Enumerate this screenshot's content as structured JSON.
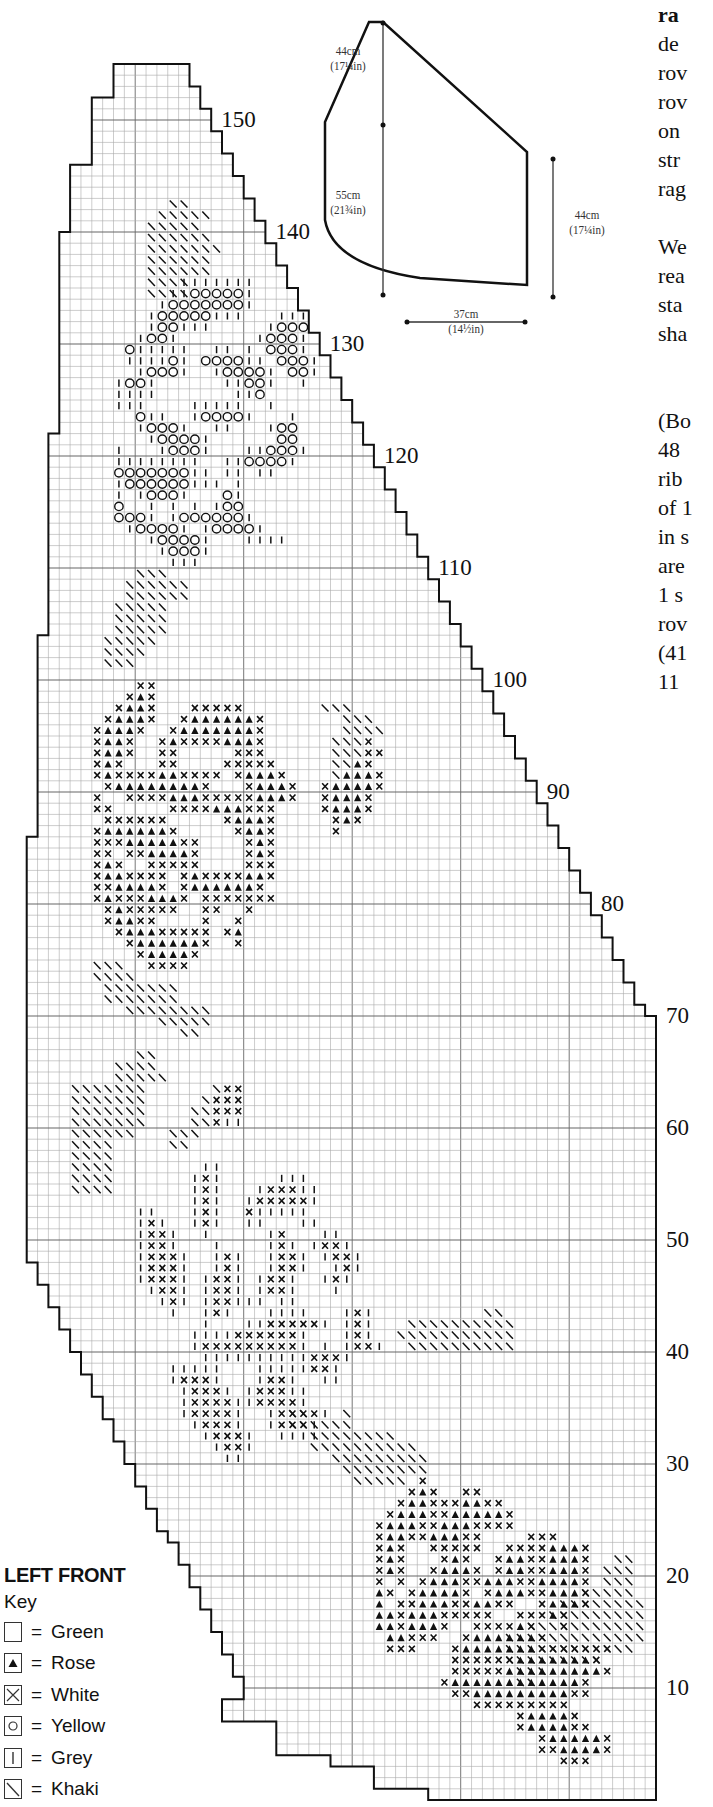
{
  "title": "LEFT FRONT",
  "key_label": "Key",
  "legend": [
    {
      "symbol": "empty-square",
      "label": "Green"
    },
    {
      "symbol": "filled-triangle",
      "label": "Rose"
    },
    {
      "symbol": "cross",
      "label": "White"
    },
    {
      "symbol": "circle",
      "label": "Yellow"
    },
    {
      "symbol": "vertical-bar",
      "label": "Grey"
    },
    {
      "symbol": "diagonal-slash",
      "label": "Khaki"
    }
  ],
  "equals": "=",
  "row_labels": [
    "10",
    "20",
    "30",
    "40",
    "50",
    "60",
    "70",
    "80",
    "90",
    "100",
    "110",
    "120",
    "130",
    "140",
    "150"
  ],
  "schematic": {
    "upper_left_height": {
      "cm": "44cm",
      "in": "(17¼in)"
    },
    "lower_left_height": {
      "cm": "55cm",
      "in": "(21¾in)"
    },
    "right_height": {
      "cm": "44cm",
      "in": "(17¼in)"
    },
    "width": {
      "cm": "37cm",
      "in": "(14½in)"
    }
  },
  "side_text_fragments": [
    {
      "text": "ra",
      "bold": true
    },
    {
      "text": "de"
    },
    {
      "text": "rov"
    },
    {
      "text": "rov"
    },
    {
      "text": "on"
    },
    {
      "text": "str"
    },
    {
      "text": "rag"
    },
    {
      "text": ""
    },
    {
      "text": "We"
    },
    {
      "text": "rea"
    },
    {
      "text": "sta"
    },
    {
      "text": "sha"
    },
    {
      "text": ""
    },
    {
      "text": ""
    },
    {
      "text": "(Bo"
    },
    {
      "text": "48"
    },
    {
      "text": "rib"
    },
    {
      "text": "of 1"
    },
    {
      "text": "in s"
    },
    {
      "text": "are"
    },
    {
      "text": "1 s"
    },
    {
      "text": "rov"
    },
    {
      "text": "(41"
    },
    {
      "text": "11"
    }
  ],
  "chart_data": {
    "type": "knitting-chart",
    "title": "LEFT FRONT",
    "rows": 155,
    "columns": 58,
    "row_label_interval": 10,
    "symbols": {
      "T": "Rose",
      "X": "White",
      "O": "Yellow",
      "I": "Grey",
      "S": "Khaki",
      ".": "Green"
    },
    "motifs": [
      {
        "name": "khaki-leaves-top",
        "row0": 143,
        "col0": 11,
        "pattern": [
          "..SS.",
          ".SSSSS",
          "SSSSS",
          "SSSSSS",
          "SSSSSSS",
          "SSSSSS",
          "SSSSSS",
          "SSSS",
          "SSSS"
        ]
      },
      {
        "name": "yellow-grey-flower",
        "row0": 136,
        "col0": 8,
        "pattern": [
          "......IIIIIII",
          ".....IIOOOOOI",
          "....IOOOOOOOI",
          "...IOOOOOIII...III",
          "...IOOIII.....IOOO",
          "..IOOI.......IOOOI",
          ".OIIIII..II.I.OOOI",
          ".IIIIOI.OOOOII.OOOI",
          "..IOOOI..IOOOOI.OOI",
          "IOOI......IIOOI..I",
          "IIII.......IIO",
          "III....IIIII..I",
          "..OII..IOOOOI...I",
          "..IOOOI..II...IOO",
          "...IOOOOI......OO",
          "I...IOOOI...IIOOOI",
          "IIIIIIII..IIOOOOI",
          "OOOOOOOII.II.II",
          "IOOOOOOIII.I",
          "I.IOOOI...OI",
          "O..I.I.I.IOO",
          "OOOI.IOOOOOOI",
          ".IOOOOI.IOOOOI",
          "...IOOOOI...IIII",
          "....IOOOI",
          ".....III"
        ]
      },
      {
        "name": "khaki-leaves-mid",
        "row0": 110,
        "col0": 7,
        "pattern": [
          "...SSS",
          "..SSSSSS",
          "..SSSSSS",
          ".SSSSS",
          ".SSSSS",
          ".SSSSS",
          "SSSSS",
          "SSSS",
          "SSS"
        ]
      },
      {
        "name": "rose-white-upper",
        "row0": 100,
        "col0": 6,
        "pattern": [
          "....XX",
          "...XTX",
          "..XTTX...XXXXX.......SSS",
          ".XTTTX..XTTTTTTX.......SSS",
          "XTTTX..XTTTTTTTX.......SSSS",
          "XTTX..XTXXXXTTTX......SSSX",
          "XTTX..XX.....XXX......SSSXX",
          "XTX...XX....XXXXX.....SSTX",
          "XTXXXXTTXXXX.XTTTX....STTTX",
          ".XTTTTTTTTX...XTTTX..XTTTTX",
          "X..XXXXTTTXXXXXTTTX..XTTTX",
          "XX.....XXXXTTTXXX....XTTTX",
          ".XXXXXX.....XTTTX.....XTX",
          "XTTTTTTX.....XTTX.....X",
          "XXXTTTTTXX....XTX",
          "XX.XXTTTTX....XTX",
          "XTX..XXXXX....XXX",
          "XTTXXXX.XTXXXXTTX",
          "XXTTTTX.XTTTTTTX",
          "XTXXXTTTX.XXXXXXX",
          ".XTXXXXX..XX..X",
          ".XTTXX....X..X",
          "..XTTTXXXXX.XT",
          "...XTTTTTTX..X",
          "....XTTTTX",
          ".....XXXX"
        ]
      },
      {
        "name": "khaki-leaves-lower",
        "row0": 75,
        "col0": 4,
        "pattern": [
          "..SSS",
          "..SSSS",
          "...SSSSSSS",
          "...SSSSSSS",
          ".....SSSSSSSS",
          "........SSSSS",
          "..........SS",
          "",
          "......SS",
          "....SSSS",
          "....SSSSS",
          "SSSSSSS......SXX",
          "SSSSSSS.....SXXX",
          "SSSSSSS....SSXXX",
          "SSSSSSS....SSXII",
          "SSSSSS...SSS",
          "SSSS.....SS",
          "SSSS",
          "SSSS",
          "SSSS",
          "SSSS"
        ]
      },
      {
        "name": "white-grey-flower",
        "row0": 57,
        "col0": 8,
        "pattern": [
          "........II",
          ".......IXI.....III",
          ".......IXI...IXXXII",
          ".......IXI..IXXXXXI",
          "..II...IXI..XIIIII",
          "..IXI..IXI..II...II",
          "..IXXI..I.....IX...II",
          "..IXXI...I....IXI.IXXI",
          "..IXXXI..IXI..IXXI.IXXI",
          "..IXXXI..IXI..IXXI..IXI",
          "..IXXXI.IXXI.IXXI..IXI",
          "...IXXI.IXXI.IXXI...I",
          "....IXI.IXXIII.II",
          ".....I..IXI...IIII...IXI",
          "........I...IIXXXXXI.IXI",
          ".......IIIIXXXXXXI...IXI",
          ".......IXXXXXXXXXI.I.IXXI",
          "........IIIIIIIIIIXXXI",
          ".....IIIII...IIIIIXXI",
          ".....IXXXI...IXXI..II",
          "......IXXXI.IXXXII",
          "......IXXXXIIXXXXI",
          "......IXXXXI..IXXXXI",
          ".......IXXXI..IXXXI",
          "........IXXXI..IIII",
          ".........IXXI",
          "..........II"
        ]
      },
      {
        "name": "khaki-leaves-right",
        "row0": 44,
        "col0": 24,
        "pattern": [
          "..................SS",
          "...........SSSSSSSSSS",
          "..........SSSSSSSSSSS",
          "...........SSSSSSSSSS",
          "",
          "",
          "",
          "",
          "",
          "SS...S",
          "SSSSSS",
          "..SSSSSSSS",
          "..SSSSSSSSSS",
          "....SSSSSSSSS",
          ".....SSSSSSSS",
          "......SSSSS"
        ]
      },
      {
        "name": "rose-white-lower",
        "row0": 29,
        "col0": 26,
        "pattern": [
          "..........X",
          ".........XTX..XX",
          "........XTTXXXTTXX",
          ".......XTTTXXTTTTTX",
          "......XTTTXXTTTXXXX",
          "......XTTXXTTTXX....XXX",
          "......XTX..XXXXX..XXXXTTTX",
          "......XTX...XTX..XTTXXTTTX",
          "......XTX..XTTTX.XTTXXTTTX",
          "......X.X.XTTTXXTTTXXTTTTX",
          "......TX.XTTTTX.XTTTXXTTTX",
          "......T.XXTTTXXTTXX..XTTTX",
          "......TTXTTTXXXXX..XXXTX",
          "......TTXTTTX..XXXXTX..X",
          ".......TTXXX..XTTTTTTX",
          ".......XXX...XTTTTTTTXXXXXXX",
          ".............XXXXXXTTTTTTTX",
          ".............XXXXXTTTTTTTTTX",
          "............XTTTTTTTTTTTTX",
          ".............XXTTTTTTTTTXX",
          "...............XXXXXXXXX",
          "...................XTTTTX",
          "...................XTTTTXX",
          ".....................XTTTTTX",
          ".....................XXTTTTX",
          ".......................XXX"
        ]
      },
      {
        "name": "khaki-leaves-bottom-right",
        "row0": 22,
        "col0": 44,
        "pattern": [
          "..........SS",
          ".........SSS",
          ".........SSS",
          ".......SSSSS",
          ".....SSSSSSSS",
          "....SSSSSSSSS",
          "..SSSSSSSSSSS",
          "SSSSSSSSSSSSS",
          "SSSSSSSSSSSS",
          "SSSSSSSSS",
          ".SSS",
          ".SS"
        ]
      }
    ]
  }
}
